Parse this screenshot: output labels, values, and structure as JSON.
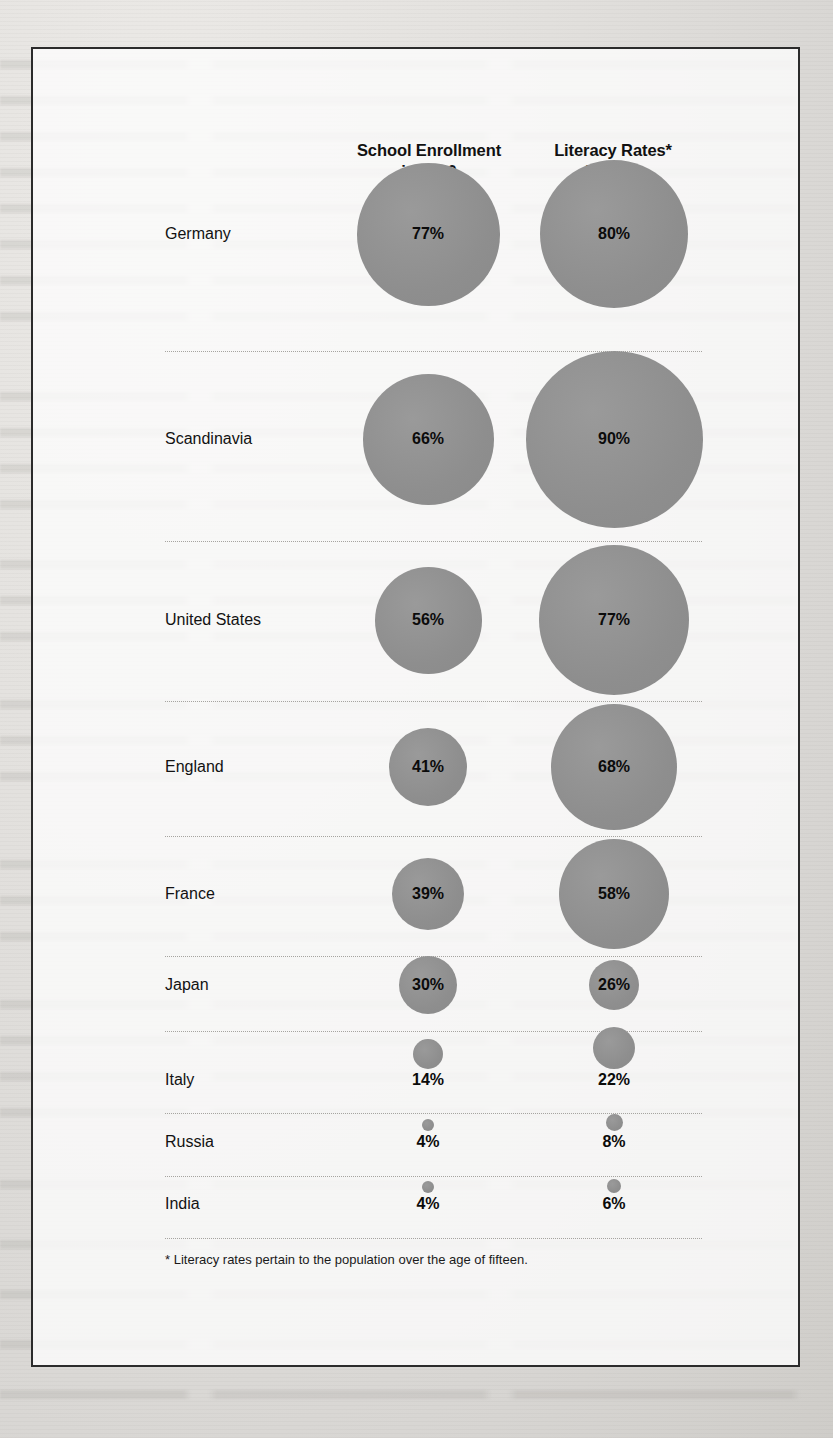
{
  "figure": {
    "headers": {
      "enrollment": {
        "line1": "School Enrollment",
        "line2": "in 1830"
      },
      "literacy": {
        "line1": "Literacy Rates*",
        "line2": "in 1850"
      }
    },
    "footnote": "* Literacy rates pertain to the population over the age of fifteen.",
    "bubble_color": "#919191",
    "frame_color": "#2b2b2b",
    "rule_color": "#a6a4a0"
  },
  "chart_data": {
    "type": "bubble",
    "series": [
      {
        "name": "School Enrollment in 1830",
        "values": [
          77,
          66,
          56,
          41,
          39,
          30,
          14,
          4,
          4
        ]
      },
      {
        "name": "Literacy Rates* in 1850",
        "values": [
          80,
          90,
          77,
          68,
          58,
          26,
          22,
          8,
          6
        ]
      }
    ],
    "categories": [
      "Germany",
      "Scandinavia",
      "United States",
      "England",
      "France",
      "Japan",
      "Italy",
      "Russia",
      "India"
    ],
    "unit": "%",
    "xlabel": "",
    "ylabel": "",
    "legend": [
      "School Enrollment in 1830",
      "Literacy Rates* in 1850"
    ],
    "notes": "* Literacy rates pertain to the population over the age of fifteen."
  },
  "rows": [
    {
      "label": "Germany",
      "enroll": "77%",
      "literacy": "80%",
      "enroll_d": 143,
      "literacy_d": 148,
      "label_y": 72,
      "row_top": 160,
      "row_h": 190,
      "inside": true
    },
    {
      "label": "Scandinavia",
      "enroll": "66%",
      "literacy": "90%",
      "enroll_d": 131,
      "literacy_d": 177,
      "label_y": 87,
      "row_top": 350,
      "row_h": 190,
      "inside": true
    },
    {
      "label": "United States",
      "enroll": "56%",
      "literacy": "77%",
      "enroll_d": 107,
      "literacy_d": 150,
      "label_y": 78,
      "row_top": 540,
      "row_h": 160,
      "inside": true
    },
    {
      "label": "England",
      "enroll": "41%",
      "literacy": "68%",
      "enroll_d": 78,
      "literacy_d": 126,
      "label_y": 65,
      "row_top": 700,
      "row_h": 135,
      "inside": true
    },
    {
      "label": "France",
      "enroll": "39%",
      "literacy": "58%",
      "enroll_d": 72,
      "literacy_d": 110,
      "label_y": 57,
      "row_top": 835,
      "row_h": 120,
      "inside": true
    },
    {
      "label": "Japan",
      "enroll": "30%",
      "literacy": "26%",
      "enroll_d": 58,
      "literacy_d": 50,
      "label_y": 28,
      "row_top": 955,
      "row_h": 75,
      "inside": true
    },
    {
      "label": "Italy",
      "enroll": "14%",
      "literacy": "22%",
      "enroll_d": 30,
      "literacy_d": 42,
      "label_y": 48,
      "row_top": 1030,
      "row_h": 82,
      "inside": false
    },
    {
      "label": "Russia",
      "enroll": "4%",
      "literacy": "8%",
      "enroll_d": 12,
      "literacy_d": 17,
      "label_y": 28,
      "row_top": 1112,
      "row_h": 63,
      "inside": false
    },
    {
      "label": "India",
      "enroll": "4%",
      "literacy": "6%",
      "enroll_d": 12,
      "literacy_d": 14,
      "label_y": 27,
      "row_top": 1175,
      "row_h": 62,
      "inside": false
    }
  ]
}
